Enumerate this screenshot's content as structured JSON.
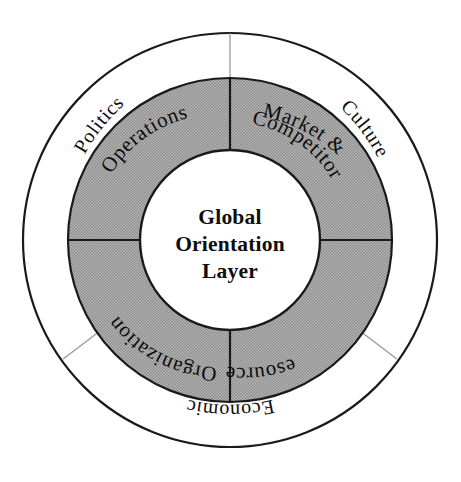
{
  "diagram": {
    "center": {
      "line1": "Global",
      "line2": "Orientation",
      "line3": "Layer"
    },
    "inner_ring": {
      "name": "inner-quadrant-ring",
      "fill_color": "#a3a3a3",
      "stroke_color": "#1a1a1a",
      "segments": [
        {
          "id": "operations",
          "label": "Operations",
          "label_line2": "",
          "position": "top-left",
          "orientation": "upright"
        },
        {
          "id": "market-and-competitor",
          "label": "Market &",
          "label_line2": "Competitor",
          "position": "top-right",
          "orientation": "upright"
        },
        {
          "id": "resources",
          "label": "Resources",
          "label_line2": "",
          "position": "bottom-right",
          "orientation": "inverted"
        },
        {
          "id": "organization",
          "label": "Organization",
          "label_line2": "",
          "position": "bottom-left",
          "orientation": "inverted"
        }
      ]
    },
    "outer_ring": {
      "name": "outer-environment-ring",
      "fill_color": "#ffffff",
      "stroke_color": "#1a1a1a",
      "divider_color": "#9a9a9a",
      "segments": [
        {
          "id": "politics",
          "label": "Politics",
          "position": "upper-left",
          "orientation": "upright"
        },
        {
          "id": "culture",
          "label": "Culture",
          "position": "upper-right",
          "orientation": "upright"
        },
        {
          "id": "economic",
          "label": "Economic",
          "position": "bottom",
          "orientation": "inverted"
        }
      ]
    }
  }
}
